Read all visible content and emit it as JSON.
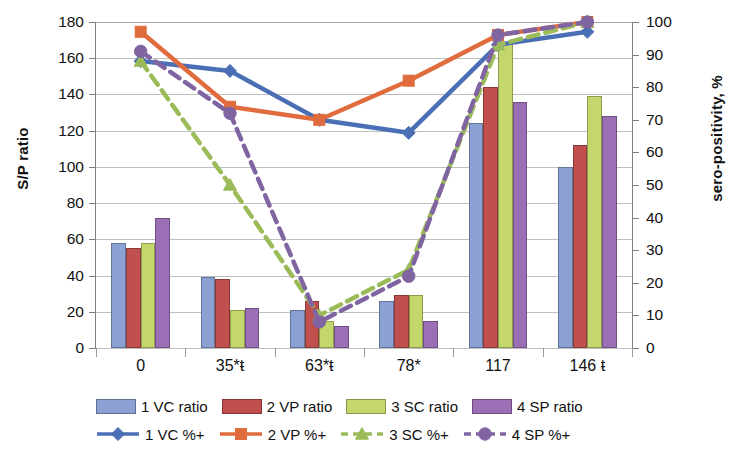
{
  "chart_data": {
    "type": "bar",
    "title": "",
    "categories": [
      "0",
      "35*ŧ",
      "63*ŧ",
      "78*",
      "117",
      "146 ŧ"
    ],
    "xlabel": "",
    "ylabel": "S/P ratio",
    "y2label": "sero-positivity, %",
    "ylim": [
      0,
      180
    ],
    "y2lim": [
      0,
      100
    ],
    "ytick_step": 20,
    "y2tick_step": 10,
    "yticks": [
      "180",
      "160",
      "140",
      "120",
      "100",
      "80",
      "60",
      "40",
      "20",
      "0"
    ],
    "y2ticks": [
      "100",
      "90",
      "80",
      "70",
      "60",
      "50",
      "40",
      "30",
      "20",
      "10",
      "0"
    ],
    "grid": true,
    "legend_position": "bottom",
    "bar_series": [
      {
        "name": "1 VC ratio",
        "color": "#8BA0D3",
        "values": [
          58,
          39,
          21,
          26,
          124,
          100
        ]
      },
      {
        "name": "2 VP ratio",
        "color": "#C0504D",
        "values": [
          55,
          38,
          26,
          29,
          144,
          112
        ]
      },
      {
        "name": "3 SC ratio",
        "color": "#C3D76C",
        "values": [
          58,
          21,
          15,
          29,
          169,
          139
        ]
      },
      {
        "name": "4 SP ratio",
        "color": "#9B6FB5",
        "values": [
          72,
          22,
          12,
          15,
          136,
          128
        ]
      }
    ],
    "line_series": [
      {
        "name": "1 VC %+",
        "color": "#4A6FB5",
        "dash": "solid",
        "marker": "diamond",
        "values": [
          88,
          85,
          70,
          66,
          93,
          97
        ]
      },
      {
        "name": "2 VP %+",
        "color": "#E06C3E",
        "dash": "solid",
        "marker": "square",
        "values": [
          97,
          74,
          70,
          82,
          96,
          100
        ]
      },
      {
        "name": "3 SC %+",
        "color": "#9BBB59",
        "dash": "dashed",
        "marker": "triangle",
        "values": [
          88,
          50,
          10,
          24,
          93,
          100
        ]
      },
      {
        "name": "4 SP %+",
        "color": "#8064A2",
        "dash": "dashed",
        "marker": "circle",
        "values": [
          91,
          72,
          8,
          22,
          96,
          100
        ]
      }
    ]
  },
  "legend": {
    "row1": [
      "1 VC ratio",
      "2 VP ratio",
      "3 SC ratio",
      "4 SP ratio"
    ],
    "row2": [
      "1 VC %+",
      "2 VP %+",
      "3 SC %+",
      "4 SP %+"
    ]
  }
}
